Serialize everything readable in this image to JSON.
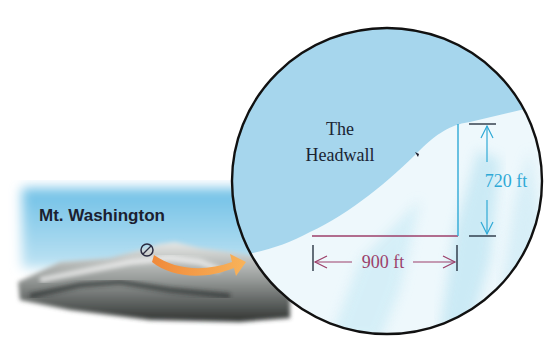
{
  "photo": {
    "label": "Mt. Washington"
  },
  "inset": {
    "title_line1": "The",
    "title_line2": "Headwall"
  },
  "dimensions": {
    "vertical": {
      "value": 720,
      "unit": "ft",
      "label": "720 ft"
    },
    "horizontal": {
      "value": 900,
      "unit": "ft",
      "label": "900 ft"
    }
  },
  "colors": {
    "sky": "#9fd2ea",
    "snow": "#eaf6fb",
    "ice_shadow": "#bfe4f2",
    "outline": "#111111",
    "vertical_dim": "#2fa9d6",
    "horizontal_dim": "#9c3f6a",
    "arrow": "#f4a048",
    "photo_sky": "#5fb3de"
  }
}
